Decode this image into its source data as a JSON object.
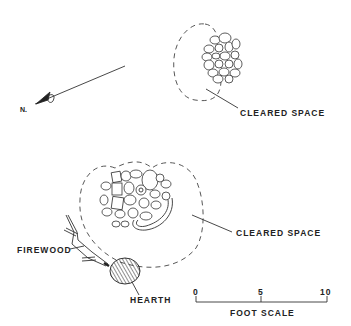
{
  "diagram": {
    "north_arrow": {
      "label": "N."
    },
    "upper_feature": {
      "label": "CLEARED SPACE",
      "components": [
        "rock-cluster",
        "cleared-space-outline"
      ]
    },
    "lower_feature": {
      "cleared_label": "CLEARED SPACE",
      "firewood_label": "FIREWOOD",
      "hearth_label": "HEARTH",
      "components": [
        "rock-cluster",
        "cleared-space-outline",
        "firewood",
        "hearth"
      ]
    },
    "scale_bar": {
      "ticks": [
        "0",
        "5",
        "10"
      ],
      "label": "FOOT SCALE"
    }
  }
}
